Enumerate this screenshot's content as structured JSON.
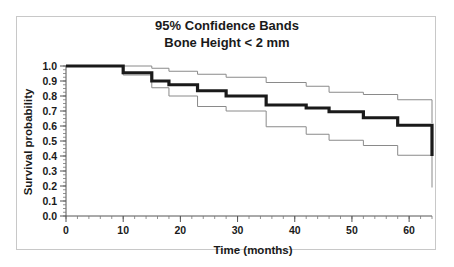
{
  "figure": {
    "background_color": "#ffffff",
    "frame_color": "#c8c8c8",
    "title_line1": "95% Confidence Bands",
    "title_line2": "Bone Height < 2 mm"
  },
  "chart_data": {
    "type": "line",
    "subtype": "kaplan-meier-step",
    "title": "95% Confidence Bands\nBone Height < 2 mm",
    "xlabel": "Time (months)",
    "ylabel": "Survival probability",
    "xlim": [
      0,
      64
    ],
    "ylim": [
      0.0,
      1.0
    ],
    "grid": false,
    "legend": "none",
    "xticks": [
      0,
      10,
      20,
      30,
      40,
      50,
      60
    ],
    "xtick_labels": [
      "0",
      "10",
      "20",
      "30",
      "40",
      "50",
      "60"
    ],
    "x_minor_interval": 2,
    "yticks": [
      0.0,
      0.1,
      0.2,
      0.3,
      0.4,
      0.5,
      0.6,
      0.7,
      0.8,
      0.9,
      1.0
    ],
    "ytick_labels": [
      "0.0",
      "0.1",
      "0.2",
      "0.3",
      "0.4",
      "0.5",
      "0.6",
      "0.7",
      "0.8",
      "0.9",
      "1.0"
    ],
    "y_minor_interval": 0.025,
    "series": [
      {
        "name": "Upper 95% confidence band",
        "style": "thin",
        "color": "#8a8a8a",
        "x": [
          0,
          10,
          15,
          18,
          23,
          28,
          35,
          42,
          46,
          52,
          58,
          64
        ],
        "values": [
          1.0,
          1.0,
          0.985,
          0.965,
          0.945,
          0.925,
          0.89,
          0.865,
          0.825,
          0.81,
          0.775,
          0.62
        ]
      },
      {
        "name": "Survival estimate",
        "style": "bold",
        "color": "#1a1a1a",
        "x": [
          0,
          6,
          10,
          15,
          18,
          23,
          28,
          35,
          42,
          46,
          52,
          58,
          64
        ],
        "values": [
          1.0,
          1.0,
          0.955,
          0.9,
          0.875,
          0.835,
          0.8,
          0.74,
          0.72,
          0.695,
          0.655,
          0.605,
          0.4
        ]
      },
      {
        "name": "Lower 95% confidence band",
        "style": "thin",
        "color": "#8a8a8a",
        "x": [
          0,
          6,
          10,
          15,
          18,
          23,
          28,
          35,
          42,
          46,
          52,
          58,
          64
        ],
        "values": [
          1.0,
          1.0,
          0.94,
          0.855,
          0.8,
          0.73,
          0.7,
          0.595,
          0.545,
          0.505,
          0.47,
          0.405,
          0.19
        ]
      }
    ]
  }
}
